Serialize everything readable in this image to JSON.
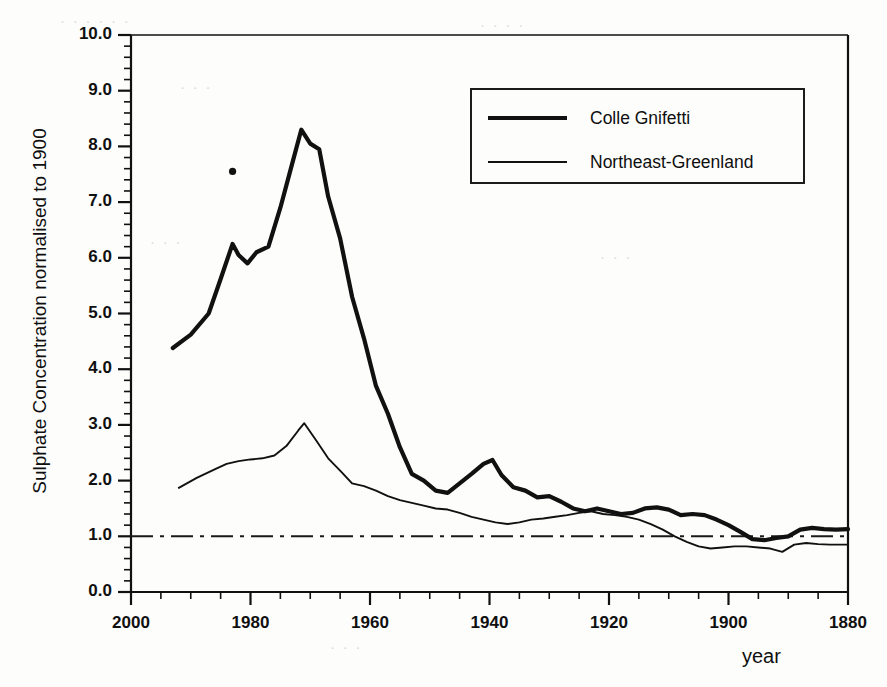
{
  "chart_data": {
    "type": "line",
    "title": "",
    "xlabel": "year",
    "ylabel": "Sulphate Concentration normalised to 1900",
    "xlim": [
      2000,
      1880
    ],
    "ylim": [
      0.0,
      10.0
    ],
    "x_axis_reversed": true,
    "grid": false,
    "x_major_ticks": [
      2000,
      1980,
      1960,
      1940,
      1920,
      1900,
      1880
    ],
    "x_tick_labels": [
      "2000",
      "1980",
      "1960",
      "1940",
      "1920",
      "1900",
      "1880"
    ],
    "x_minor_tick_interval": 5,
    "y_major_ticks": [
      0.0,
      1.0,
      2.0,
      3.0,
      4.0,
      5.0,
      6.0,
      7.0,
      8.0,
      9.0,
      10.0
    ],
    "y_tick_labels": [
      "0.0",
      "1.0",
      "2.0",
      "3.0",
      "4.0",
      "5.0",
      "6.0",
      "7.0",
      "8.0",
      "9.0",
      "10.0"
    ],
    "y_minor_tick_interval": 0.2,
    "legend_position": "top-right",
    "reference_line": {
      "name": "normalisation-baseline",
      "value": 1.0,
      "style": "dash-dot",
      "orientation": "horizontal"
    },
    "annotations": [
      {
        "name": "isolated-marker",
        "x": 1983,
        "y": 7.55,
        "style": "dot"
      }
    ],
    "series": [
      {
        "name": "Colle Gnifetti",
        "style": "thick-solid",
        "color": "#111111",
        "line_width": 4.2,
        "x": [
          1993,
          1990,
          1987,
          1985,
          1983,
          1982,
          1980.5,
          1979,
          1977,
          1975,
          1973,
          1971.5,
          1970,
          1968.5,
          1967,
          1965,
          1963,
          1961,
          1959,
          1957,
          1955,
          1953,
          1951,
          1949,
          1947,
          1945,
          1943,
          1941,
          1939.5,
          1938,
          1936,
          1934,
          1932,
          1930,
          1928,
          1926,
          1924,
          1922,
          1920,
          1918,
          1916,
          1914,
          1912,
          1910,
          1908,
          1906,
          1904,
          1902,
          1900,
          1898,
          1896,
          1894,
          1892,
          1890,
          1888,
          1886,
          1884,
          1882,
          1880
        ],
        "y": [
          4.38,
          4.62,
          5.0,
          5.62,
          6.25,
          6.05,
          5.9,
          6.1,
          6.2,
          6.9,
          7.7,
          8.3,
          8.05,
          7.95,
          7.1,
          6.35,
          5.3,
          4.55,
          3.7,
          3.2,
          2.6,
          2.12,
          2.0,
          1.82,
          1.78,
          1.95,
          2.12,
          2.3,
          2.37,
          2.1,
          1.88,
          1.82,
          1.7,
          1.72,
          1.62,
          1.5,
          1.45,
          1.5,
          1.45,
          1.4,
          1.42,
          1.5,
          1.52,
          1.48,
          1.38,
          1.4,
          1.38,
          1.3,
          1.2,
          1.08,
          0.95,
          0.93,
          0.97,
          1.0,
          1.12,
          1.15,
          1.13,
          1.12,
          1.13
        ]
      },
      {
        "name": "Northeast-Greenland",
        "style": "thin-solid",
        "color": "#111111",
        "line_width": 1.9,
        "x": [
          1992,
          1989,
          1986,
          1984,
          1982,
          1980,
          1978,
          1976,
          1974,
          1972,
          1971,
          1969,
          1967,
          1965,
          1963,
          1961,
          1959,
          1957,
          1955,
          1953,
          1951,
          1949,
          1947,
          1945,
          1943,
          1941,
          1939,
          1937,
          1935,
          1933,
          1931,
          1929,
          1927,
          1925,
          1923,
          1921,
          1919,
          1917,
          1915,
          1913,
          1911,
          1909,
          1907,
          1905,
          1903,
          1901,
          1899,
          1897,
          1895,
          1893,
          1891,
          1889,
          1887,
          1885,
          1883,
          1880
        ],
        "y": [
          1.87,
          2.05,
          2.2,
          2.3,
          2.35,
          2.38,
          2.4,
          2.45,
          2.62,
          2.9,
          3.03,
          2.72,
          2.4,
          2.18,
          1.95,
          1.9,
          1.82,
          1.72,
          1.65,
          1.6,
          1.55,
          1.5,
          1.48,
          1.42,
          1.35,
          1.3,
          1.25,
          1.22,
          1.25,
          1.3,
          1.32,
          1.35,
          1.38,
          1.42,
          1.45,
          1.4,
          1.38,
          1.35,
          1.3,
          1.22,
          1.12,
          1.0,
          0.9,
          0.82,
          0.78,
          0.8,
          0.82,
          0.82,
          0.8,
          0.78,
          0.72,
          0.85,
          0.88,
          0.86,
          0.85,
          0.85
        ]
      }
    ]
  },
  "legend": {
    "entries": [
      {
        "label": "Colle Gnifetti"
      },
      {
        "label": "Northeast-Greenland"
      }
    ]
  },
  "background_artifacts": [
    "bleed-through text",
    "scan speckle"
  ]
}
